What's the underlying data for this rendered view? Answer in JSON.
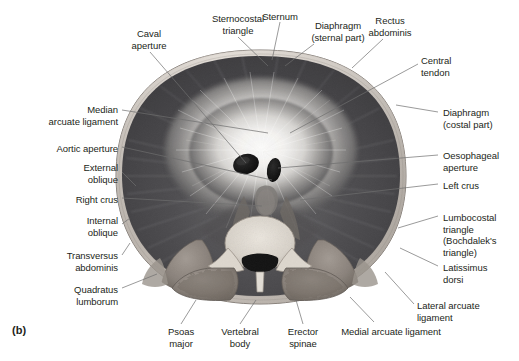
{
  "figure": {
    "marker": "(b)",
    "style": "grayscale anatomical illustration",
    "background_color": "#ffffff",
    "text_color": "#231f20",
    "leader_line_color": "#6e6e6e"
  },
  "labels": [
    {
      "id": "caval-aperture",
      "text": "Caval\naperture",
      "side": "top",
      "align": "center",
      "x": 113,
      "y": 28,
      "w": 72,
      "lx": 150,
      "ly": 52,
      "tx": 246,
      "ty": 163
    },
    {
      "id": "sternocostal-triangle",
      "text": "Sternocostal\ntriangle",
      "side": "top",
      "align": "center",
      "x": 196,
      "y": 13,
      "w": 84,
      "lx": 238,
      "ly": 37,
      "tx": 268,
      "ty": 66
    },
    {
      "id": "sternum",
      "text": "Sternum",
      "side": "top",
      "align": "center",
      "x": 252,
      "y": 11,
      "w": 56,
      "lx": 280,
      "ly": 22,
      "tx": 272,
      "ty": 60
    },
    {
      "id": "diaphragm-sternal",
      "text": "Diaphragm\n(sternal part)",
      "side": "top",
      "align": "center",
      "x": 297,
      "y": 20,
      "w": 82,
      "lx": 314,
      "ly": 44,
      "tx": 285,
      "ty": 66
    },
    {
      "id": "rectus-abdominis",
      "text": "Rectus\nabdominis",
      "side": "top",
      "align": "center",
      "x": 358,
      "y": 15,
      "w": 64,
      "lx": 383,
      "ly": 39,
      "tx": 352,
      "ty": 68
    },
    {
      "id": "central-tendon",
      "text": "Central\ntendon",
      "side": "right",
      "align": "left",
      "x": 421,
      "y": 55,
      "w": 60,
      "lx": 418,
      "ly": 64,
      "tx": 290,
      "ty": 133
    },
    {
      "id": "diaphragm-costal",
      "text": "Diaphragm\n(costal part)",
      "side": "right",
      "align": "left",
      "x": 443,
      "y": 107,
      "w": 74,
      "lx": 438,
      "ly": 112,
      "tx": 396,
      "ty": 105
    },
    {
      "id": "oesophageal-aperture",
      "text": "Oesophageal\naperture",
      "side": "right",
      "align": "left",
      "x": 443,
      "y": 150,
      "w": 76,
      "lx": 438,
      "ly": 155,
      "tx": 278,
      "ty": 168
    },
    {
      "id": "left-crus",
      "text": "Left crus",
      "side": "right",
      "align": "left",
      "x": 443,
      "y": 180,
      "w": 60,
      "lx": 438,
      "ly": 184,
      "tx": 300,
      "ty": 200
    },
    {
      "id": "lumbocostal-triangle",
      "text": "Lumbocostal\ntriangle\n(Bochdalek's\ntriangle)",
      "side": "right",
      "align": "left",
      "x": 443,
      "y": 212,
      "w": 76,
      "lx": 438,
      "ly": 216,
      "tx": 398,
      "ty": 228
    },
    {
      "id": "latissimus-dorsi",
      "text": "Latissimus\ndorsi",
      "side": "right",
      "align": "left",
      "x": 443,
      "y": 262,
      "w": 68,
      "lx": 438,
      "ly": 266,
      "tx": 400,
      "ty": 248
    },
    {
      "id": "lateral-arcuate",
      "text": "Lateral arcuate\nligament",
      "side": "right",
      "align": "left",
      "x": 417,
      "y": 300,
      "w": 84,
      "lx": 414,
      "ly": 304,
      "tx": 385,
      "ty": 272
    },
    {
      "id": "median-arcuate",
      "text": "Median\narcuate ligament",
      "side": "left",
      "align": "right",
      "x": 18,
      "y": 104,
      "w": 100,
      "lx": 122,
      "ly": 110,
      "tx": 268,
      "ty": 133
    },
    {
      "id": "aortic-aperture",
      "text": "Aortic aperture",
      "side": "left",
      "align": "right",
      "x": 18,
      "y": 143,
      "w": 100,
      "lx": 122,
      "ly": 147,
      "tx": 272,
      "ty": 180
    },
    {
      "id": "external-oblique",
      "text": "External\noblique",
      "side": "left",
      "align": "right",
      "x": 40,
      "y": 162,
      "w": 78,
      "lx": 122,
      "ly": 172,
      "tx": 136,
      "ty": 186
    },
    {
      "id": "right-crus",
      "text": "Right crus",
      "side": "left",
      "align": "right",
      "x": 38,
      "y": 194,
      "w": 80,
      "lx": 122,
      "ly": 198,
      "tx": 262,
      "ty": 206
    },
    {
      "id": "internal-oblique",
      "text": "Internal\noblique",
      "side": "left",
      "align": "right",
      "x": 40,
      "y": 215,
      "w": 78,
      "lx": 122,
      "ly": 224,
      "tx": 130,
      "ty": 218
    },
    {
      "id": "transversus-abdominis",
      "text": "Transversus\nabdominis",
      "side": "left",
      "align": "right",
      "x": 22,
      "y": 250,
      "w": 96,
      "lx": 122,
      "ly": 255,
      "tx": 130,
      "ty": 243
    },
    {
      "id": "quadratus-lumborum",
      "text": "Quadratus\nlumborum",
      "side": "left",
      "align": "right",
      "x": 30,
      "y": 284,
      "w": 88,
      "lx": 122,
      "ly": 288,
      "tx": 157,
      "ty": 274
    },
    {
      "id": "psoas-major",
      "text": "Psoas\nmajor",
      "side": "bottom",
      "align": "center",
      "x": 157,
      "y": 326,
      "w": 48,
      "lx": 181,
      "ly": 324,
      "tx": 196,
      "ty": 300
    },
    {
      "id": "vertebral-body",
      "text": "Vertebral\nbody",
      "side": "bottom",
      "align": "center",
      "x": 212,
      "y": 326,
      "w": 56,
      "lx": 240,
      "ly": 324,
      "tx": 256,
      "ty": 300
    },
    {
      "id": "erector-spinae",
      "text": "Erector\nspinae",
      "side": "bottom",
      "align": "center",
      "x": 278,
      "y": 326,
      "w": 50,
      "lx": 303,
      "ly": 324,
      "tx": 296,
      "ty": 300
    },
    {
      "id": "medial-arcuate",
      "text": "Medial arcuate ligament",
      "side": "bottom",
      "align": "center",
      "x": 330,
      "y": 326,
      "w": 122,
      "lx": 374,
      "ly": 322,
      "tx": 350,
      "ty": 297
    }
  ],
  "anatomy": {
    "torso_outline": "oval trunk cross-section",
    "central_tendon_color": "#f2f2f0",
    "diaphragm_dome_color": "#4a4a4c",
    "body_wall_color": "#cfcac4",
    "muscle_color": "#8e8781",
    "vertebra_color": "#ded9d2",
    "aperture_color": "#1a1a1a",
    "regions": [
      {
        "name": "central-tendon",
        "note": "bright radiating fibrous sheet at center"
      },
      {
        "name": "caval-aperture",
        "note": "dark oval opening, right of midline"
      },
      {
        "name": "oesophageal-aperture",
        "note": "dark slit opening, left of midline"
      },
      {
        "name": "aortic-aperture",
        "note": "opening beneath median arcuate ligament"
      },
      {
        "name": "vertebral-body",
        "note": "cancellous bone with spinal canal"
      },
      {
        "name": "erector-spinae",
        "note": "paired paraspinal muscle masses"
      },
      {
        "name": "psoas-major",
        "note": "paired muscles lateral to vertebral body"
      },
      {
        "name": "quadratus-lumborum",
        "note": "posterolateral muscle"
      },
      {
        "name": "abdominal-wall-layers",
        "note": "external oblique, internal oblique, transversus abdominis"
      }
    ]
  }
}
